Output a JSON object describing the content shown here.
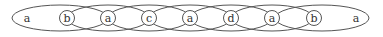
{
  "diagram": {
    "type": "overlapping-ellipse-chain",
    "ellipses": [
      {
        "cx": 60,
        "rx": 48
      },
      {
        "cx": 108,
        "rx": 41
      },
      {
        "cx": 149,
        "rx": 41
      },
      {
        "cx": 190,
        "rx": 41
      },
      {
        "cx": 231,
        "rx": 41
      },
      {
        "cx": 272,
        "rx": 41
      },
      {
        "cx": 322,
        "rx": 47
      }
    ],
    "nodes": [
      {
        "label": "a",
        "x": 27,
        "circled": false
      },
      {
        "label": "b",
        "x": 67,
        "circled": true
      },
      {
        "label": "a",
        "x": 108,
        "circled": true
      },
      {
        "label": "c",
        "x": 149,
        "circled": true
      },
      {
        "label": "a",
        "x": 190,
        "circled": true
      },
      {
        "label": "d",
        "x": 231,
        "circled": true
      },
      {
        "label": "a",
        "x": 272,
        "circled": true
      },
      {
        "label": "b",
        "x": 314,
        "circled": true
      },
      {
        "label": "a",
        "x": 356,
        "circled": false
      }
    ]
  }
}
